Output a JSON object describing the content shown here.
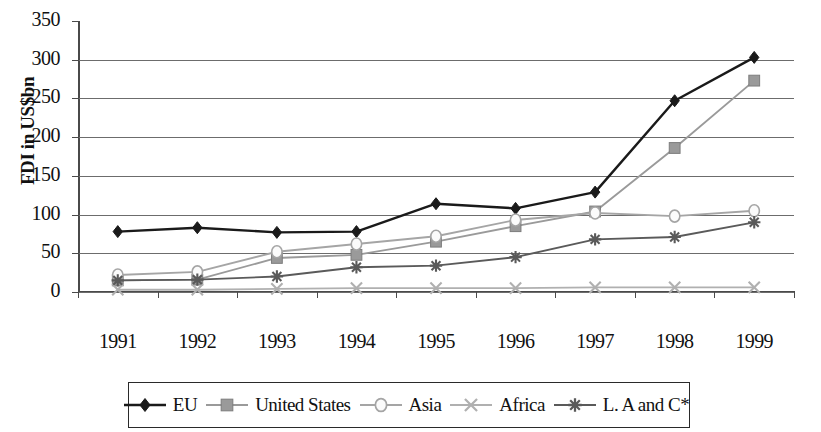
{
  "chart_data": {
    "type": "line",
    "title": "",
    "xlabel": "",
    "ylabel": "FDI in US$bn",
    "categories": [
      "1991",
      "1992",
      "1993",
      "1994",
      "1995",
      "1996",
      "1997",
      "1998",
      "1999"
    ],
    "ylim": [
      0,
      350
    ],
    "ytick_values": [
      0,
      50,
      100,
      150,
      200,
      250,
      300,
      350
    ],
    "ytick_labels": [
      "0",
      "50",
      "100",
      "150",
      "200",
      "250",
      "300",
      "350"
    ],
    "grid": true,
    "legend_position": "bottom",
    "series": [
      {
        "name": "EU",
        "marker": "filled-diamond",
        "color": "#1a1a1a",
        "values": [
          78,
          83,
          77,
          78,
          114,
          108,
          129,
          247,
          303
        ]
      },
      {
        "name": "United States",
        "marker": "filled-square",
        "color": "#9a9a9a",
        "values": [
          15,
          16,
          44,
          48,
          65,
          85,
          104,
          186,
          273
        ]
      },
      {
        "name": "Asia",
        "marker": "open-circle",
        "color": "#a5a5a5",
        "values": [
          22,
          26,
          52,
          62,
          72,
          93,
          102,
          98,
          105
        ]
      },
      {
        "name": "Africa",
        "marker": "cross-x",
        "color": "#b0b0b0",
        "values": [
          3,
          3,
          4,
          5,
          5,
          5,
          6,
          6,
          6
        ]
      },
      {
        "name": "L. A and C*",
        "marker": "asterisk",
        "color": "#5a5a5a",
        "values": [
          15,
          16,
          20,
          32,
          34,
          45,
          68,
          71,
          90
        ]
      }
    ]
  },
  "legend": {
    "items": [
      {
        "label": "EU",
        "marker": "filled-diamond"
      },
      {
        "label": "United States",
        "marker": "filled-square"
      },
      {
        "label": "Asia",
        "marker": "open-circle"
      },
      {
        "label": "Africa",
        "marker": "cross-x"
      },
      {
        "label": "L. A and C*",
        "marker": "asterisk"
      }
    ]
  }
}
